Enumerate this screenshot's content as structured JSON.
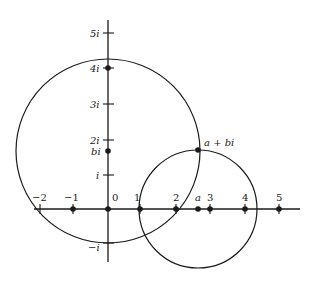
{
  "diagram": {
    "title": "",
    "colors": {
      "stroke": "#1a1a1a",
      "background": "#ffffff"
    },
    "real_axis_labels": {
      "neg2": "−2",
      "neg1": "−1",
      "zero": "0",
      "one": "1",
      "two": "2",
      "a": "a",
      "three": "3",
      "four": "4",
      "five": "5"
    },
    "imag_axis_labels": {
      "five_i": "5i",
      "four_i": "4i",
      "three_i": "3i",
      "two_i": "2i",
      "bi": "bi",
      "i": "i",
      "neg_i": "−i"
    },
    "point_label": "a + bi",
    "circles": [
      {
        "name": "large-circle",
        "center": "bi",
        "passes_through": [
          "1",
          "-1",
          "a+bi"
        ]
      },
      {
        "name": "small-circle",
        "center": "a",
        "passes_through": [
          "1",
          "a+bi"
        ]
      }
    ]
  }
}
